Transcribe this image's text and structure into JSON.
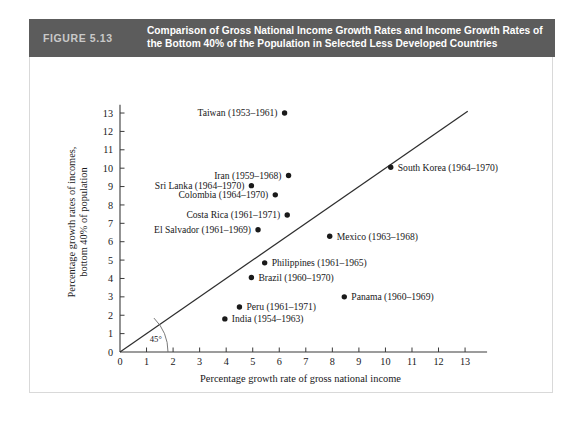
{
  "figure": {
    "number_label": "FIGURE 5.13",
    "title_line1": "Comparison of Gross National Income Growth Rates and Income Growth Rates of",
    "title_line2": "the Bottom 40% of the Population in Selected Less Developed Countries",
    "header_bg": "#5c5c5c",
    "number_color": "#c9c9c9",
    "title_color": "#ffffff"
  },
  "chart_data": {
    "type": "scatter",
    "title": "Comparison of Gross National Income Growth Rates and Income Growth Rates of the Bottom 40% of the Population in Selected Less Developed Countries",
    "xlabel": "Percentage growth rate of gross national income",
    "ylabel": "Percentage growth rates of incomes, bottom 40% of population",
    "ylabel_line1": "Percentage growth rates of incomes,",
    "ylabel_line2": "bottom 40% of population",
    "xlim": [
      0,
      13.6
    ],
    "ylim": [
      0,
      13.6
    ],
    "xticks": [
      0,
      1,
      2,
      3,
      4,
      5,
      6,
      7,
      8,
      9,
      10,
      11,
      12,
      13
    ],
    "yticks": [
      0,
      1,
      2,
      3,
      4,
      5,
      6,
      7,
      8,
      9,
      10,
      11,
      12,
      13
    ],
    "grid": false,
    "legend": "none",
    "annotations": [
      {
        "name": "forty-five-degree-label",
        "text": "45°",
        "x": 1.35,
        "y": 0.55
      },
      {
        "name": "diagonal-reference-line",
        "text": "45-degree line",
        "from": [
          0,
          0
        ],
        "to": [
          13.1,
          13.1
        ]
      }
    ],
    "points": [
      {
        "label": "Taiwan (1953–1961)",
        "x": 6.2,
        "y": 13.0,
        "label_side": "left"
      },
      {
        "label": "Iran (1959–1968)",
        "x": 6.35,
        "y": 9.6,
        "label_side": "left"
      },
      {
        "label": "South Korea (1964–1970)",
        "x": 10.2,
        "y": 10.05,
        "label_side": "right"
      },
      {
        "label": "Sri Lanka (1964–1970)",
        "x": 4.95,
        "y": 9.05,
        "label_side": "left"
      },
      {
        "label": "Colombia (1964–1970)",
        "x": 5.85,
        "y": 8.55,
        "label_side": "left"
      },
      {
        "label": "Costa Rica (1961–1971)",
        "x": 6.3,
        "y": 7.45,
        "label_side": "left"
      },
      {
        "label": "El Salvador (1961–1969)",
        "x": 5.2,
        "y": 6.65,
        "label_side": "left"
      },
      {
        "label": "Mexico (1963–1968)",
        "x": 7.9,
        "y": 6.3,
        "label_side": "right"
      },
      {
        "label": "Philippines (1961–1965)",
        "x": 5.45,
        "y": 4.85,
        "label_side": "right"
      },
      {
        "label": "Brazil (1960–1970)",
        "x": 4.95,
        "y": 4.05,
        "label_side": "right"
      },
      {
        "label": "Panama (1960–1969)",
        "x": 8.45,
        "y": 3.0,
        "label_side": "right"
      },
      {
        "label": "Peru (1961–1971)",
        "x": 4.5,
        "y": 2.45,
        "label_side": "right"
      },
      {
        "label": "India (1954–1963)",
        "x": 3.95,
        "y": 1.8,
        "label_side": "right"
      }
    ]
  }
}
